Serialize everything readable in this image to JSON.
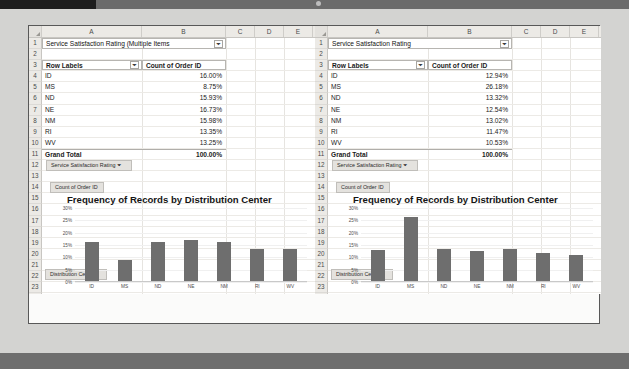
{
  "figure": {
    "panels": [
      {
        "id": "panel-a",
        "caption": "(a) Orders with Service Satisfaction Rating",
        "sheet": {
          "column_headers": [
            "A",
            "B",
            "C",
            "D",
            "E"
          ],
          "row_numbers": [
            1,
            2,
            3,
            4,
            5,
            6,
            7,
            8,
            9,
            10,
            11,
            12,
            13,
            14,
            15,
            16,
            17,
            18,
            19,
            20,
            21,
            22,
            23,
            24,
            25,
            26
          ],
          "report_filter_label": "Service Satisfaction Rating",
          "report_filter_value": "(Multiple Items",
          "filter_icon": "filter-icon",
          "table_headers": [
            "Row Labels",
            "Count of Order ID"
          ],
          "rows": [
            {
              "label": "ID",
              "value": "16.00%"
            },
            {
              "label": "MS",
              "value": "8.75%"
            },
            {
              "label": "ND",
              "value": "15.93%"
            },
            {
              "label": "NE",
              "value": "16.73%"
            },
            {
              "label": "NM",
              "value": "15.98%"
            },
            {
              "label": "RI",
              "value": "13.35%"
            },
            {
              "label": "WV",
              "value": "13.25%"
            }
          ],
          "total_label": "Grand Total",
          "total_value": "100.00%",
          "field_buttons": [
            "Service Satisfaction Rating",
            "Count of Order ID"
          ],
          "axis_field_button": "Distribution Center"
        },
        "chart_data": {
          "type": "bar",
          "title": "Frequency of Records by Distribution Center",
          "categories": [
            "ID",
            "MS",
            "ND",
            "NE",
            "NM",
            "RI",
            "WV"
          ],
          "values": [
            16.0,
            8.75,
            15.93,
            16.73,
            15.98,
            13.35,
            13.25
          ],
          "yticks": [
            "30%",
            "25%",
            "20%",
            "15%",
            "10%",
            "5%",
            "0%"
          ],
          "ytick_values": [
            30,
            25,
            20,
            15,
            10,
            5,
            0
          ],
          "ylim": [
            0,
            30
          ],
          "xlabel": "",
          "ylabel": "",
          "grid": true,
          "legend": "none",
          "series_color": "#6e6e6e"
        }
      },
      {
        "id": "panel-b",
        "caption": "(b) Orders without Service Satisfaction Rating",
        "sheet": {
          "column_headers": [
            "A",
            "B",
            "C",
            "D",
            "E"
          ],
          "row_numbers": [
            1,
            2,
            3,
            4,
            5,
            6,
            7,
            8,
            9,
            10,
            11,
            12,
            13,
            14,
            15,
            16,
            17,
            18,
            19,
            20,
            21,
            22,
            23,
            24,
            25,
            26
          ],
          "report_filter_label": "Service Satisfaction Rating",
          "report_filter_value": "",
          "filter_icon": "filter-icon",
          "table_headers": [
            "Row Labels",
            "Count of Order ID"
          ],
          "rows": [
            {
              "label": "ID",
              "value": "12.94%"
            },
            {
              "label": "MS",
              "value": "26.18%"
            },
            {
              "label": "ND",
              "value": "13.32%"
            },
            {
              "label": "NE",
              "value": "12.54%"
            },
            {
              "label": "NM",
              "value": "13.02%"
            },
            {
              "label": "RI",
              "value": "11.47%"
            },
            {
              "label": "WV",
              "value": "10.53%"
            }
          ],
          "total_label": "Grand Total",
          "total_value": "100.00%",
          "field_buttons": [
            "Service Satisfaction Rating",
            "Count of Order ID"
          ],
          "axis_field_button": "Distribution Center"
        },
        "chart_data": {
          "type": "bar",
          "title": "Frequency of Records by Distribution Center",
          "categories": [
            "ID",
            "MS",
            "ND",
            "NE",
            "NM",
            "RI",
            "WV"
          ],
          "values": [
            12.94,
            26.18,
            13.32,
            12.54,
            13.02,
            11.47,
            10.53
          ],
          "yticks": [
            "30%",
            "25%",
            "20%",
            "15%",
            "10%",
            "5%",
            "0%"
          ],
          "ytick_values": [
            30,
            25,
            20,
            15,
            10,
            5,
            0
          ],
          "ylim": [
            0,
            30
          ],
          "xlabel": "",
          "ylabel": "",
          "grid": true,
          "legend": "none",
          "series_color": "#6e6e6e"
        }
      }
    ]
  }
}
